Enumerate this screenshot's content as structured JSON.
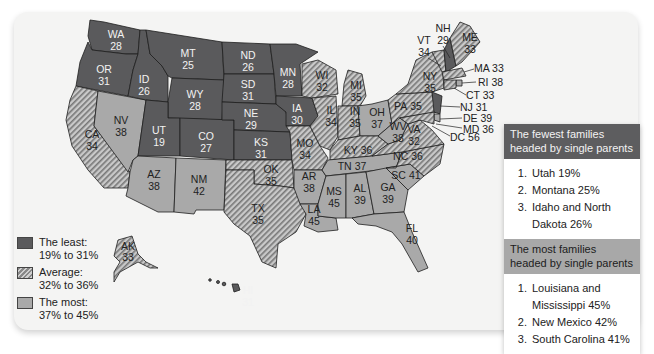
{
  "map": {
    "title": "Single-parent families by state (%)",
    "states": {
      "WA": {
        "label": "WA",
        "value": "28",
        "category": "least"
      },
      "OR": {
        "label": "OR",
        "value": "31",
        "category": "least"
      },
      "CA": {
        "label": "CA",
        "value": "34",
        "category": "average"
      },
      "NV": {
        "label": "NV",
        "value": "38",
        "category": "most"
      },
      "ID": {
        "label": "ID",
        "value": "26",
        "category": "least"
      },
      "MT": {
        "label": "MT",
        "value": "25",
        "category": "least"
      },
      "WY": {
        "label": "WY",
        "value": "28",
        "category": "least"
      },
      "UT": {
        "label": "UT",
        "value": "19",
        "category": "least"
      },
      "CO": {
        "label": "CO",
        "value": "27",
        "category": "least"
      },
      "AZ": {
        "label": "AZ",
        "value": "38",
        "category": "most"
      },
      "NM": {
        "label": "NM",
        "value": "42",
        "category": "most"
      },
      "ND": {
        "label": "ND",
        "value": "26",
        "category": "least"
      },
      "SD": {
        "label": "SD",
        "value": "31",
        "category": "least"
      },
      "NE": {
        "label": "NE",
        "value": "29",
        "category": "least"
      },
      "KS": {
        "label": "KS",
        "value": "31",
        "category": "least"
      },
      "OK": {
        "label": "OK",
        "value": "35",
        "category": "average"
      },
      "TX": {
        "label": "TX",
        "value": "35",
        "category": "average"
      },
      "MN": {
        "label": "MN",
        "value": "28",
        "category": "least"
      },
      "IA": {
        "label": "IA",
        "value": "30",
        "category": "least"
      },
      "MO": {
        "label": "MO",
        "value": "34",
        "category": "average"
      },
      "AR": {
        "label": "AR",
        "value": "38",
        "category": "most"
      },
      "LA": {
        "label": "LA",
        "value": "45",
        "category": "most"
      },
      "WI": {
        "label": "WI",
        "value": "32",
        "category": "average"
      },
      "IL": {
        "label": "IL",
        "value": "34",
        "category": "average"
      },
      "MI": {
        "label": "MI",
        "value": "35",
        "category": "average"
      },
      "IN": {
        "label": "IN",
        "value": "35",
        "category": "average"
      },
      "OH": {
        "label": "OH",
        "value": "37",
        "category": "most"
      },
      "KY": {
        "label": "KY",
        "value": "36",
        "category": "average"
      },
      "TN": {
        "label": "TN",
        "value": "37",
        "category": "most"
      },
      "MS": {
        "label": "MS",
        "value": "45",
        "category": "most"
      },
      "AL": {
        "label": "AL",
        "value": "39",
        "category": "most"
      },
      "GA": {
        "label": "GA",
        "value": "39",
        "category": "most"
      },
      "FL": {
        "label": "FL",
        "value": "40",
        "category": "most"
      },
      "SC": {
        "label": "SC",
        "value": "41",
        "category": "most"
      },
      "NC": {
        "label": "NC",
        "value": "36",
        "category": "average"
      },
      "VA": {
        "label": "VA",
        "value": "32",
        "category": "average"
      },
      "WV": {
        "label": "WV",
        "value": "38",
        "category": "most"
      },
      "PA": {
        "label": "PA",
        "value": "35",
        "category": "average"
      },
      "NY": {
        "label": "NY",
        "value": "35",
        "category": "average"
      },
      "VT": {
        "label": "VT",
        "value": "34",
        "category": "average"
      },
      "NH": {
        "label": "NH",
        "value": "29",
        "category": "least"
      },
      "ME": {
        "label": "ME",
        "value": "33",
        "category": "average"
      },
      "MA": {
        "label": "MA 33",
        "value": "33",
        "category": "average"
      },
      "RI": {
        "label": "RI 38",
        "value": "38",
        "category": "most"
      },
      "CT": {
        "label": "CT 33",
        "value": "33",
        "category": "average"
      },
      "NJ": {
        "label": "NJ 31",
        "value": "31",
        "category": "least"
      },
      "DE": {
        "label": "DE 39",
        "value": "39",
        "category": "most"
      },
      "MD": {
        "label": "MD 36",
        "value": "36",
        "category": "average"
      },
      "DC": {
        "label": "DC 56",
        "value": "56",
        "category": "most"
      },
      "AK": {
        "label": "AK",
        "value": "33",
        "category": "average"
      },
      "HI": {
        "label": "HI",
        "value": "31",
        "category": "least"
      }
    }
  },
  "legend": {
    "items": [
      {
        "line1": "The least:",
        "line2": "19% to 31%",
        "category": "least"
      },
      {
        "line1": "Average:",
        "line2": "32% to 36%",
        "category": "average"
      },
      {
        "line1": "The most:",
        "line2": "37% to 45%",
        "category": "most"
      }
    ]
  },
  "panel": {
    "fewest": {
      "title": "The fewest families headed by single parents",
      "items": [
        "Utah 19%",
        "Montana 25%",
        "Idaho and North Dakota 26%"
      ]
    },
    "most": {
      "title": "The most families headed by single parents",
      "items": [
        "Louisiana  and Mississippi 45%",
        "New Mexico 42%",
        "South Carolina 41%"
      ]
    }
  },
  "colors": {
    "least": "#5a5a5c",
    "average_hatch_dark": "#7a7a7a",
    "average_hatch_light": "#c8c8c8",
    "most": "#a9a9a9",
    "card_bg": "#f4f4f3"
  }
}
